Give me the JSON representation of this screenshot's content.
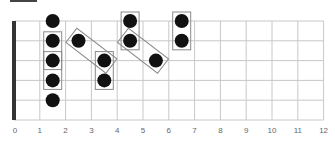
{
  "diagram": {
    "type": "guitar-fretboard",
    "fret_count": 12,
    "string_count": 6,
    "fret_labels": [
      "0",
      "1",
      "2",
      "3",
      "4",
      "5",
      "6",
      "7",
      "8",
      "9",
      "10",
      "11",
      "12"
    ],
    "colors": {
      "nut": "#333333",
      "grid": "#c8c8c8",
      "dot": "#111111",
      "box": "#8a8a8a",
      "label": "#666666"
    },
    "geometry": {
      "nut_x": 14,
      "fret_spacing": 25.8,
      "first_string_y": 21,
      "string_spacing": 19.8,
      "dot_radius": 7,
      "label_y": 133
    },
    "notes": [
      {
        "string": 1,
        "fret": 1.5
      },
      {
        "string": 2,
        "fret": 1.5
      },
      {
        "string": 3,
        "fret": 1.5
      },
      {
        "string": 4,
        "fret": 1.5
      },
      {
        "string": 5,
        "fret": 1.5
      },
      {
        "string": 2,
        "fret": 2.5
      },
      {
        "string": 3,
        "fret": 3.5
      },
      {
        "string": 4,
        "fret": 3.5
      },
      {
        "string": 1,
        "fret": 4.5
      },
      {
        "string": 2,
        "fret": 4.5
      },
      {
        "string": 3,
        "fret": 5.5
      },
      {
        "string": 1,
        "fret": 6.5
      },
      {
        "string": 2,
        "fret": 6.5
      }
    ],
    "boxes": [
      {
        "from": {
          "string": 2,
          "fret": 1.5
        },
        "to": {
          "string": 3,
          "fret": 1.5
        }
      },
      {
        "from": {
          "string": 3,
          "fret": 1.5
        },
        "to": {
          "string": 4,
          "fret": 1.5
        }
      },
      {
        "from": {
          "string": 2,
          "fret": 2.5
        },
        "to": {
          "string": 3,
          "fret": 3.5
        }
      },
      {
        "from": {
          "string": 3,
          "fret": 3.5
        },
        "to": {
          "string": 4,
          "fret": 3.5
        }
      },
      {
        "from": {
          "string": 1,
          "fret": 4.5
        },
        "to": {
          "string": 2,
          "fret": 4.5
        }
      },
      {
        "from": {
          "string": 2,
          "fret": 4.5
        },
        "to": {
          "string": 3,
          "fret": 5.5
        }
      },
      {
        "from": {
          "string": 1,
          "fret": 6.5
        },
        "to": {
          "string": 2,
          "fret": 6.5
        }
      }
    ]
  }
}
